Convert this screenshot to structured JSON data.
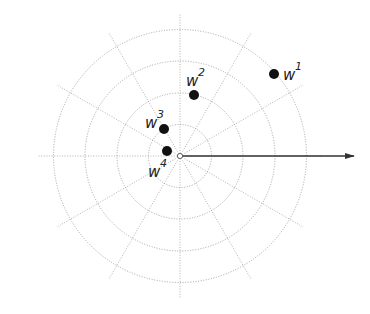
{
  "diagram": {
    "type": "polar-grid-with-points",
    "center": {
      "x": 180,
      "y": 156
    },
    "ring_radii": [
      31.5,
      63,
      95,
      126.5
    ],
    "spoke_angles_deg": [
      0,
      30,
      60,
      90,
      120,
      150,
      180,
      210,
      240,
      270,
      300,
      330
    ],
    "spoke_length": 142,
    "arrow": {
      "from": {
        "x": 182,
        "y": 156
      },
      "to": {
        "x": 354,
        "y": 156
      },
      "color": "#333333"
    },
    "grid_color": "#a0a0a0",
    "point_color": "#111111",
    "points": [
      {
        "id": "w1",
        "base": "w",
        "sup": "1",
        "x": 274,
        "y": 74,
        "label_x": 283,
        "label_y": 80,
        "sup_dx": 12,
        "sup_dy": -10
      },
      {
        "id": "w2",
        "base": "w",
        "sup": "2",
        "x": 194,
        "y": 95,
        "label_x": 186,
        "label_y": 86,
        "sup_dx": 12,
        "sup_dy": -10
      },
      {
        "id": "w3",
        "base": "w",
        "sup": "3",
        "x": 164,
        "y": 129,
        "label_x": 145,
        "label_y": 128,
        "sup_dx": 12,
        "sup_dy": -10
      },
      {
        "id": "w4",
        "base": "w",
        "sup": "4",
        "x": 167,
        "y": 151,
        "label_x": 148,
        "label_y": 177,
        "sup_dx": 12,
        "sup_dy": -10
      }
    ]
  }
}
